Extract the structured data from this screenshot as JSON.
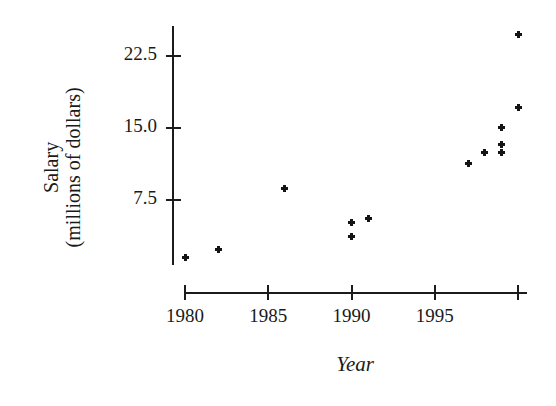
{
  "chart_data": {
    "type": "scatter",
    "title": "",
    "xlabel": "Year",
    "ylabel": "Salary\n(millions of dollars)",
    "xlim": [
      1979,
      2000.8
    ],
    "ylim": [
      0,
      26
    ],
    "grid": false,
    "legend": "none",
    "x_ticks": [
      1980,
      1985,
      1990,
      1995,
      2000
    ],
    "x_tick_labels": [
      "1980",
      "1985",
      "1990",
      "1995",
      ""
    ],
    "y_ticks": [
      7.5,
      15.0,
      22.5
    ],
    "y_tick_labels": [
      "7.5",
      "15.0",
      "22.5"
    ],
    "series": [
      {
        "name": "Average salary",
        "points": [
          {
            "x": 1980,
            "y": 1.5
          },
          {
            "x": 1982,
            "y": 2.3
          },
          {
            "x": 1986,
            "y": 8.7
          },
          {
            "x": 1990,
            "y": 3.7
          },
          {
            "x": 1990,
            "y": 5.2
          },
          {
            "x": 1991,
            "y": 5.6
          },
          {
            "x": 1997,
            "y": 11.3
          },
          {
            "x": 1998,
            "y": 12.5
          },
          {
            "x": 1999,
            "y": 12.5
          },
          {
            "x": 1999,
            "y": 13.3
          },
          {
            "x": 1999,
            "y": 15.1
          },
          {
            "x": 2000,
            "y": 17.1
          },
          {
            "x": 2000,
            "y": 24.7
          }
        ]
      }
    ]
  },
  "axes": {
    "y_label_line1": "Salary",
    "y_label_line2": "(millions of dollars)",
    "x_label": "Year"
  }
}
